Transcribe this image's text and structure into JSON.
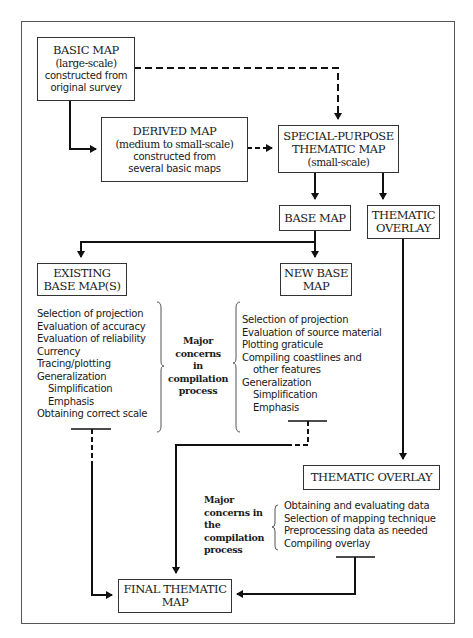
{
  "diagram": {
    "nodes": {
      "basic_map": {
        "title": "BASIC MAP",
        "lines": [
          "(large-scale)",
          "constructed from",
          "original survey"
        ]
      },
      "derived_map": {
        "title": "DERIVED MAP",
        "lines": [
          "(medium to small-scale)",
          "constructed from",
          "several basic maps"
        ]
      },
      "special_purpose": {
        "title_lines": [
          "SPECIAL-PURPOSE",
          "THEMATIC MAP"
        ],
        "sub": "(small-scale)"
      },
      "base_map": {
        "title": "BASE MAP"
      },
      "thematic_overlay_top": {
        "title_lines": [
          "THEMATIC",
          "OVERLAY"
        ]
      },
      "existing_base_maps": {
        "title_lines": [
          "EXISTING",
          "BASE MAP(S)"
        ]
      },
      "new_base_map": {
        "title_lines": [
          "NEW BASE",
          "MAP"
        ]
      },
      "thematic_overlay_bottom": {
        "title": "THEMATIC OVERLAY"
      },
      "final_thematic_map": {
        "title_lines": [
          "FINAL THEMATIC",
          "MAP"
        ]
      }
    },
    "existing_concerns": {
      "items": [
        "Selection of projection",
        "Evaluation of accuracy",
        "Evaluation of reliability",
        "Currency",
        "Tracing/plotting",
        "Generalization"
      ],
      "sub_items": [
        "Simplification",
        "Emphasis"
      ],
      "last": "Obtaining correct scale"
    },
    "center_label": {
      "lines": [
        "Major",
        "concerns",
        "in",
        "compilation",
        "process"
      ]
    },
    "new_base_concerns": {
      "items": [
        "Selection of projection",
        "Evaluation of source material",
        "Plotting graticule",
        "Compiling coastlines and"
      ],
      "continued": "other features",
      "generalization": "Generalization",
      "sub_items": [
        "Simplification",
        "Emphasis"
      ]
    },
    "overlay_label": {
      "lines": [
        "Major",
        "concerns in",
        "the",
        "compilation",
        "process"
      ]
    },
    "overlay_concerns": {
      "items": [
        "Obtaining and evaluating data",
        "Selection of mapping technique",
        "Preprocessing data as needed",
        "Compiling overlay"
      ]
    },
    "edges": [
      {
        "from": "BASIC MAP",
        "to": "DERIVED MAP",
        "style": "solid"
      },
      {
        "from": "BASIC MAP",
        "to": "SPECIAL-PURPOSE THEMATIC MAP",
        "style": "dashed"
      },
      {
        "from": "DERIVED MAP",
        "to": "SPECIAL-PURPOSE THEMATIC MAP",
        "style": "dashed"
      },
      {
        "from": "SPECIAL-PURPOSE THEMATIC MAP",
        "to": "BASE MAP",
        "style": "solid"
      },
      {
        "from": "SPECIAL-PURPOSE THEMATIC MAP",
        "to": "THEMATIC OVERLAY",
        "style": "solid"
      },
      {
        "from": "BASE MAP",
        "to": "EXISTING BASE MAP(S)",
        "style": "solid"
      },
      {
        "from": "BASE MAP",
        "to": "NEW BASE MAP",
        "style": "solid"
      },
      {
        "from": "THEMATIC OVERLAY",
        "to": "THEMATIC OVERLAY (compiled)",
        "style": "solid"
      },
      {
        "from": "EXISTING BASE MAP(S)",
        "to": "FINAL THEMATIC MAP",
        "style": "dashed-then-solid"
      },
      {
        "from": "NEW BASE MAP",
        "to": "FINAL THEMATIC MAP",
        "style": "dashed-then-solid"
      },
      {
        "from": "THEMATIC OVERLAY (compiled)",
        "to": "FINAL THEMATIC MAP",
        "style": "solid"
      }
    ]
  }
}
